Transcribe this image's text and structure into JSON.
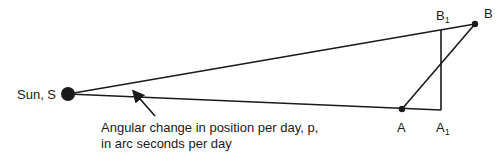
{
  "diagram": {
    "sun_label": "Sun, S",
    "points": {
      "A": {
        "label": "A"
      },
      "A1": {
        "label": "A",
        "sub": "1"
      },
      "B": {
        "label": "B"
      },
      "B1": {
        "label": "B",
        "sub": "1"
      }
    },
    "annotation": {
      "line1": "Angular change in position per day, p,",
      "line2": "in arc seconds per day"
    },
    "colors": {
      "ink": "#1a1a1a",
      "background": "#ffffff"
    }
  }
}
